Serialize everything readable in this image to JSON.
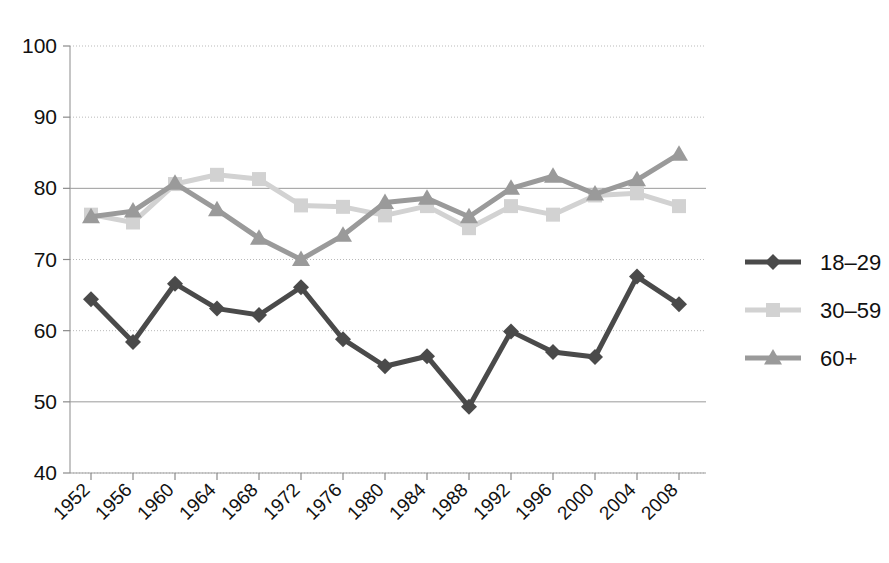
{
  "chart_data": {
    "type": "line",
    "title": "",
    "subtitle": "",
    "xlabel": "",
    "ylabel": "",
    "grid": true,
    "legend_position": "right",
    "ylim": [
      40,
      100
    ],
    "yticks": [
      40,
      50,
      60,
      70,
      80,
      90,
      100
    ],
    "categories": [
      "1952",
      "1956",
      "1960",
      "1964",
      "1968",
      "1972",
      "1976",
      "1980",
      "1984",
      "1988",
      "1992",
      "1996",
      "2000",
      "2004",
      "2008"
    ],
    "xtick_rotation_deg": 45,
    "series": [
      {
        "name": "18–29",
        "marker": "diamond",
        "color": "#4a4a4a",
        "values": [
          64.4,
          58.4,
          66.6,
          63.1,
          62.2,
          66.1,
          58.8,
          55.0,
          56.4,
          49.3,
          59.9,
          57.0,
          56.3,
          67.6,
          63.7
        ]
      },
      {
        "name": "30–59",
        "marker": "square",
        "color": "#d2d2d2",
        "values": [
          76.3,
          75.2,
          80.6,
          81.9,
          81.3,
          77.6,
          77.4,
          76.2,
          77.5,
          74.4,
          77.5,
          76.3,
          79.0,
          79.3,
          77.5
        ]
      },
      {
        "name": "60+",
        "marker": "triangle",
        "color": "#9a9a9a",
        "values": [
          76.0,
          76.8,
          80.7,
          77.0,
          73.0,
          70.0,
          73.4,
          78.0,
          78.6,
          76.0,
          80.0,
          81.7,
          79.2,
          81.2,
          84.8
        ]
      }
    ],
    "legend": [
      {
        "label": "18–29",
        "marker": "diamond",
        "color": "#4a4a4a"
      },
      {
        "label": "30–59",
        "marker": "square",
        "color": "#d2d2d2"
      },
      {
        "label": "60+",
        "marker": "triangle",
        "color": "#9a9a9a"
      }
    ]
  }
}
